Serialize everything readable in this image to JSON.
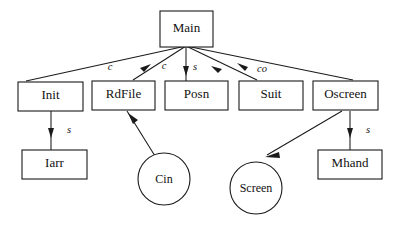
{
  "diagram": {
    "type": "module-dependency-tree",
    "background_color": "#ffffff",
    "stroke_color": "#1a1a1a",
    "root": "Main",
    "nodes": [
      {
        "id": "main",
        "label": "Main",
        "shape": "rect",
        "x": 160,
        "y": 11,
        "w": 53,
        "h": 36
      },
      {
        "id": "init",
        "label": "Init",
        "shape": "rect",
        "x": 18,
        "y": 82,
        "w": 65,
        "h": 29
      },
      {
        "id": "rdfile",
        "label": "RdFile",
        "shape": "rect",
        "x": 92,
        "y": 81,
        "w": 63,
        "h": 29
      },
      {
        "id": "posn",
        "label": "Posn",
        "shape": "rect",
        "x": 165,
        "y": 81,
        "w": 63,
        "h": 29
      },
      {
        "id": "suit",
        "label": "Suit",
        "shape": "rect",
        "x": 239,
        "y": 81,
        "w": 64,
        "h": 29
      },
      {
        "id": "oscreen",
        "label": "Oscreen",
        "shape": "rect",
        "x": 313,
        "y": 81,
        "w": 65,
        "h": 29
      },
      {
        "id": "iarr",
        "label": "Iarr",
        "shape": "rect",
        "x": 22,
        "y": 150,
        "w": 65,
        "h": 29
      },
      {
        "id": "mhand",
        "label": "Mhand",
        "shape": "rect",
        "x": 318,
        "y": 150,
        "w": 64,
        "h": 29
      },
      {
        "id": "cin",
        "label": "Cin",
        "shape": "circle",
        "cx": 164,
        "cy": 179,
        "r": 26
      },
      {
        "id": "screen",
        "label": "Screen",
        "shape": "circle",
        "cx": 256,
        "cy": 188,
        "r": 26
      }
    ],
    "edges": [
      {
        "id": "main-init",
        "from": "main",
        "to": "init",
        "label": "",
        "arrow": "none"
      },
      {
        "id": "main-rdfile",
        "from": "main",
        "to": "rdfile",
        "label": "c",
        "arrow": "to-main"
      },
      {
        "id": "main-posn",
        "from": "main",
        "to": "posn",
        "label": "c",
        "arrow": "to-child"
      },
      {
        "id": "main-suit",
        "from": "main",
        "to": "suit",
        "label": "s",
        "arrow": "to-main"
      },
      {
        "id": "main-oscreen",
        "from": "main",
        "to": "oscreen",
        "label": "co",
        "arrow": "to-main"
      },
      {
        "id": "init-iarr",
        "from": "init",
        "to": "iarr",
        "label": "s",
        "arrow": "to-child"
      },
      {
        "id": "rdfile-cin",
        "from": "cin",
        "to": "rdfile",
        "label": "",
        "arrow": "to-rdfile"
      },
      {
        "id": "oscreen-screen",
        "from": "oscreen",
        "to": "screen",
        "label": "",
        "arrow": "to-screen"
      },
      {
        "id": "oscreen-mhand",
        "from": "oscreen",
        "to": "mhand",
        "label": "s",
        "arrow": "to-child"
      }
    ],
    "edge_labels": {
      "rdfile": "c",
      "posn": "c",
      "suit": "s",
      "oscreen": "co",
      "iarr": "s",
      "mhand": "s"
    }
  }
}
